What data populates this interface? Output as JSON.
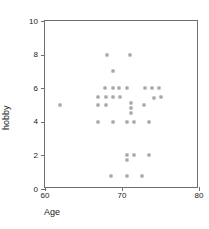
{
  "chart_data": {
    "type": "scatter",
    "title": "",
    "xlabel": "Age",
    "ylabel": "hobby",
    "xlim": [
      60,
      80
    ],
    "ylim": [
      0,
      10
    ],
    "xticks": [
      60,
      70,
      80
    ],
    "yticks": [
      0,
      2,
      4,
      6,
      8,
      10
    ],
    "grid": false,
    "legend": null,
    "marker": "open-square",
    "marker_color": "#8a8a8a",
    "points": [
      {
        "x": 68.0,
        "y": 8.0
      },
      {
        "x": 71.0,
        "y": 8.0
      },
      {
        "x": 68.8,
        "y": 7.0
      },
      {
        "x": 67.8,
        "y": 6.0
      },
      {
        "x": 68.8,
        "y": 6.0
      },
      {
        "x": 69.6,
        "y": 6.0
      },
      {
        "x": 70.6,
        "y": 6.0
      },
      {
        "x": 73.0,
        "y": 6.0
      },
      {
        "x": 73.9,
        "y": 6.0
      },
      {
        "x": 74.8,
        "y": 6.0
      },
      {
        "x": 66.9,
        "y": 5.5
      },
      {
        "x": 67.9,
        "y": 5.5
      },
      {
        "x": 68.8,
        "y": 5.5
      },
      {
        "x": 69.8,
        "y": 5.5
      },
      {
        "x": 74.2,
        "y": 5.4
      },
      {
        "x": 75.0,
        "y": 5.5
      },
      {
        "x": 66.9,
        "y": 5.0
      },
      {
        "x": 67.9,
        "y": 5.0
      },
      {
        "x": 61.9,
        "y": 5.0
      },
      {
        "x": 71.2,
        "y": 5.1
      },
      {
        "x": 71.2,
        "y": 4.8
      },
      {
        "x": 72.9,
        "y": 5.0
      },
      {
        "x": 71.2,
        "y": 4.5
      },
      {
        "x": 66.9,
        "y": 4.0
      },
      {
        "x": 68.8,
        "y": 4.0
      },
      {
        "x": 70.6,
        "y": 4.0
      },
      {
        "x": 71.6,
        "y": 4.0
      },
      {
        "x": 73.5,
        "y": 4.0
      },
      {
        "x": 70.6,
        "y": 2.0
      },
      {
        "x": 71.5,
        "y": 2.0
      },
      {
        "x": 73.5,
        "y": 2.0
      },
      {
        "x": 70.6,
        "y": 1.7
      },
      {
        "x": 68.6,
        "y": 0.8
      },
      {
        "x": 70.6,
        "y": 0.8
      },
      {
        "x": 72.6,
        "y": 0.8
      }
    ]
  }
}
